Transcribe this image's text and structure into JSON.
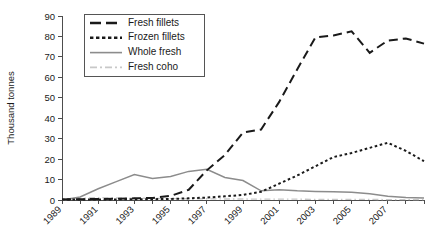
{
  "chart_data": {
    "type": "line",
    "title": "",
    "xlabel": "",
    "ylabel": "Thousand tonnes",
    "ylim": [
      0,
      90
    ],
    "ytick_step": 10,
    "yticks": [
      0,
      10,
      20,
      30,
      40,
      50,
      60,
      70,
      80,
      90
    ],
    "xlim": [
      1989,
      2009
    ],
    "x": [
      1989,
      1990,
      1991,
      1992,
      1993,
      1994,
      1995,
      1996,
      1997,
      1998,
      1999,
      2000,
      2001,
      2002,
      2003,
      2004,
      2005,
      2006,
      2007,
      2008,
      2009
    ],
    "xticks": [
      1989,
      1990,
      1991,
      1992,
      1993,
      1994,
      1995,
      1996,
      1997,
      1998,
      1999,
      2000,
      2001,
      2002,
      2003,
      2004,
      2005,
      2006,
      2007,
      2008,
      2009
    ],
    "xticklabels_shown": [
      "1989",
      "1991",
      "1993",
      "1995",
      "1997",
      "1999",
      "2001",
      "2003",
      "2005",
      "2007"
    ],
    "xticklabel_years": [
      1989,
      1991,
      1993,
      1995,
      1997,
      1999,
      2001,
      2003,
      2005,
      2007
    ],
    "xticklabel_rotation": -45,
    "grid": false,
    "legend_position": "upper-left-inside",
    "series": [
      {
        "name": "Fresh fillets",
        "style": "long-dash",
        "color": "#1a1a1a",
        "values": [
          0.3,
          0.4,
          0.5,
          0.6,
          0.8,
          1.0,
          2.0,
          5.0,
          14.5,
          22.0,
          33.0,
          34.5,
          48.0,
          64.0,
          79.5,
          80.5,
          82.5,
          72.0,
          78.0,
          79.0,
          76.5
        ]
      },
      {
        "name": "Frozen fillets",
        "style": "short-dash",
        "color": "#1a1a1a",
        "values": [
          0.2,
          0.2,
          0.3,
          0.3,
          0.4,
          0.4,
          0.5,
          0.8,
          1.2,
          1.8,
          2.5,
          4.0,
          8.0,
          12.0,
          16.5,
          21.0,
          23.0,
          25.5,
          28.0,
          24.0,
          19.0
        ]
      },
      {
        "name": "Whole fresh",
        "style": "solid",
        "color": "#8c8c8c",
        "values": [
          0.0,
          1.5,
          5.5,
          9.0,
          12.5,
          10.5,
          11.5,
          14.0,
          15.0,
          11.0,
          9.5,
          4.5,
          5.0,
          4.5,
          4.2,
          4.0,
          3.8,
          3.0,
          1.8,
          1.2,
          1.0
        ]
      },
      {
        "name": "Fresh coho",
        "style": "dash-dot",
        "color": "#c8c8c8",
        "values": [
          0.1,
          0.8,
          1.2,
          1.0,
          0.9,
          0.8,
          0.7,
          0.6,
          0.6,
          0.5,
          0.5,
          0.4,
          0.4,
          0.4,
          0.3,
          0.3,
          0.3,
          0.3,
          0.2,
          0.2,
          0.2
        ]
      }
    ]
  },
  "axes": {
    "y_title": "Thousand tonnes"
  },
  "legend": {
    "entries": [
      {
        "label": "Fresh fillets"
      },
      {
        "label": "Frozen fillets"
      },
      {
        "label": "Whole fresh"
      },
      {
        "label": "Fresh coho"
      }
    ]
  }
}
